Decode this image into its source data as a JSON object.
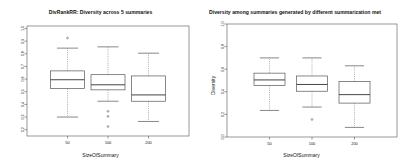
{
  "figures": [
    {
      "id": "divrank-figure",
      "title": "DivRankRR: Diversity across 5 summaries",
      "xlabel": "SizeOfSummary",
      "ylabel": ""
    },
    {
      "id": "summarization-figure",
      "title": "Diversity among summaries generated by different summarization met",
      "xlabel": "SizeOfSummary",
      "ylabel": "Diversity"
    }
  ],
  "chart_data": [
    {
      "type": "boxplot",
      "title": "DivRankRR: Diversity across 5 summaries",
      "xlabel": "SizeOfSummary",
      "ylabel": "",
      "categories": [
        "50",
        "100",
        "200"
      ],
      "xtick_labels": [
        "50",
        "100",
        "200"
      ],
      "ytick_labels": [
        "0.2",
        "0.3",
        "0.4",
        "0.5",
        "0.6",
        "0.7",
        "0.8",
        "0.9",
        "1.0"
      ],
      "ylim": [
        0.15,
        1.02
      ],
      "grid": false,
      "legend": "none",
      "boxes": [
        {
          "category": "50",
          "whisker_low": 0.3,
          "q1": 0.525,
          "median": 0.595,
          "q3": 0.665,
          "whisker_high": 0.845,
          "outliers": [
            0.925
          ]
        },
        {
          "category": "100",
          "whisker_low": 0.425,
          "q1": 0.515,
          "median": 0.555,
          "q3": 0.635,
          "whisker_high": 0.855,
          "outliers": [
            0.345,
            0.305,
            0.225
          ]
        },
        {
          "category": "200",
          "whisker_low": 0.265,
          "q1": 0.425,
          "median": 0.475,
          "q3": 0.625,
          "whisker_high": 0.805,
          "outliers": []
        }
      ]
    },
    {
      "type": "boxplot",
      "title": "Diversity among summaries generated by different summarization met",
      "xlabel": "SizeOfSummary",
      "ylabel": "Diversity",
      "categories": [
        "50",
        "100",
        "200"
      ],
      "xtick_labels": [
        "50",
        "100",
        "200"
      ],
      "ytick_labels": [
        "0.0",
        "0.2",
        "0.4",
        "0.6",
        "0.8",
        "1.0"
      ],
      "ylim": [
        0.0,
        1.0
      ],
      "grid": false,
      "legend": "none",
      "boxes": [
        {
          "category": "50",
          "whisker_low": 0.235,
          "q1": 0.455,
          "median": 0.505,
          "q3": 0.565,
          "whisker_high": 0.7,
          "outliers": []
        },
        {
          "category": "100",
          "whisker_low": 0.265,
          "q1": 0.405,
          "median": 0.465,
          "q3": 0.54,
          "whisker_high": 0.7,
          "outliers": [
            0.155
          ]
        },
        {
          "category": "200",
          "whisker_low": 0.085,
          "q1": 0.3,
          "median": 0.375,
          "q3": 0.49,
          "whisker_high": 0.63,
          "outliers": []
        }
      ]
    }
  ],
  "colors": {
    "axis": "#555555",
    "box_stroke": "#555555",
    "median": "#444444",
    "whisker": "#777777",
    "text": "#111111",
    "background": "#ffffff"
  }
}
